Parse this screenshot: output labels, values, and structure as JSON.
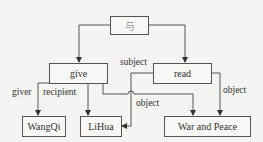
{
  "diagram": {
    "nodes": [
      {
        "id": "root",
        "label": "与"
      },
      {
        "id": "give",
        "label": "give"
      },
      {
        "id": "read",
        "label": "read"
      },
      {
        "id": "wangqi",
        "label": "WangQi"
      },
      {
        "id": "lihua",
        "label": "LiHua"
      },
      {
        "id": "war_and_peace",
        "label": "War and Peace"
      }
    ],
    "edges": [
      {
        "from": "root",
        "to": "give",
        "label": ""
      },
      {
        "from": "root",
        "to": "read",
        "label": ""
      },
      {
        "from": "give",
        "to": "wangqi",
        "label": "giver"
      },
      {
        "from": "give",
        "to": "lihua",
        "label": "recipient"
      },
      {
        "from": "give",
        "to": "war_and_peace",
        "label": "object"
      },
      {
        "from": "read",
        "to": "lihua",
        "label": "subject"
      },
      {
        "from": "read",
        "to": "war_and_peace",
        "label": "object"
      }
    ],
    "edge_labels": {
      "giver": "giver",
      "recipient": "recipient",
      "give_object": "object",
      "subject": "subject",
      "read_object": "object"
    }
  }
}
